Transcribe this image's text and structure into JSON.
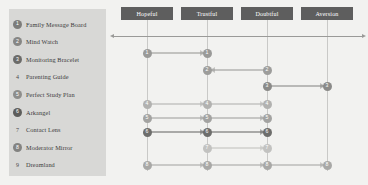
{
  "diagram": {
    "type": "flow-matrix",
    "background_color": "#f2f2f0",
    "legend": {
      "panel_color": "#d8d8d6",
      "items": [
        {
          "number": "1",
          "label": "Family Message Board",
          "marker": "filled-circle",
          "color": "#7d7d7b"
        },
        {
          "number": "2",
          "label": "Mind Watch",
          "marker": "filled-circle",
          "color": "#868684"
        },
        {
          "number": "3",
          "label": "Monitoring Bracelet",
          "marker": "filled-circle",
          "color": "#6b6b69"
        },
        {
          "number": "4",
          "label": "Parenting Guide",
          "marker": "plain-number",
          "color": "#4a4a4a"
        },
        {
          "number": "5",
          "label": "Perfect Study Plan",
          "marker": "filled-circle",
          "color": "#8e8e8c"
        },
        {
          "number": "6",
          "label": "Arkangel",
          "marker": "filled-circle",
          "color": "#5d5d5b"
        },
        {
          "number": "7",
          "label": "Contact Lens",
          "marker": "plain-number",
          "color": "#4a4a4a"
        },
        {
          "number": "8",
          "label": "Moderator Mirror",
          "marker": "filled-circle",
          "color": "#838381"
        },
        {
          "number": "9",
          "label": "Dreamland",
          "marker": "plain-number",
          "color": "#4a4a4a"
        }
      ]
    },
    "columns": [
      {
        "label": "Hopeful",
        "center_x": 147
      },
      {
        "label": "Trustful",
        "center_x": 207
      },
      {
        "label": "Doubtful",
        "center_x": 267
      },
      {
        "label": "Aversion",
        "center_x": 327
      }
    ],
    "column_header_color": "#5e5e5e",
    "axis": {
      "y": 36,
      "left_x": 114,
      "right_x": 362,
      "color": "#9a9a98",
      "arrowheads": "both"
    },
    "rows": [
      {
        "number": "1",
        "y": 53,
        "node_color": "#9a9a98",
        "nodes": [
          1,
          2
        ],
        "arrows": [
          {
            "from": 1,
            "to": 2,
            "direction": "right"
          }
        ]
      },
      {
        "number": "2",
        "y": 70,
        "node_color": "#9d9d9b",
        "nodes": [
          2,
          3
        ],
        "arrows": [
          {
            "from": 3,
            "to": 2,
            "direction": "left"
          }
        ]
      },
      {
        "number": "3",
        "y": 86,
        "node_color": "#8a8a88",
        "nodes": [
          3,
          4
        ],
        "arrows": [
          {
            "from": 3,
            "to": 4,
            "direction": "right"
          }
        ]
      },
      {
        "number": "4",
        "y": 104,
        "node_color": "#b2b2b0",
        "nodes": [
          1,
          2,
          3
        ],
        "arrows": [
          {
            "from": 1,
            "to": 2,
            "direction": "right"
          },
          {
            "from": 2,
            "to": 3,
            "direction": "right"
          }
        ]
      },
      {
        "number": "5",
        "y": 118,
        "node_color": "#a3a3a1",
        "nodes": [
          1,
          2,
          3
        ],
        "arrows": [
          {
            "from": 1,
            "to": 2,
            "direction": "right"
          },
          {
            "from": 2,
            "to": 3,
            "direction": "right"
          }
        ]
      },
      {
        "number": "6",
        "y": 132,
        "node_color": "#6e6e6c",
        "nodes": [
          1,
          2,
          3
        ],
        "arrows": [
          {
            "from": 1,
            "to": 2,
            "direction": "right"
          },
          {
            "from": 2,
            "to": 3,
            "direction": "right"
          }
        ]
      },
      {
        "number": "7",
        "y": 148,
        "node_color": "#c2c2c0",
        "nodes": [
          2,
          3
        ],
        "arrows": [
          {
            "from": 2,
            "to": 3,
            "direction": "right"
          }
        ]
      },
      {
        "number": "8",
        "y": 165,
        "node_color": "#a8a8a6",
        "nodes": [
          1,
          2,
          3,
          4
        ],
        "arrows": [
          {
            "from": 1,
            "to": 2,
            "direction": "right"
          },
          {
            "from": 2,
            "to": 3,
            "direction": "right"
          },
          {
            "from": 3,
            "to": 4,
            "direction": "right"
          }
        ]
      }
    ]
  }
}
